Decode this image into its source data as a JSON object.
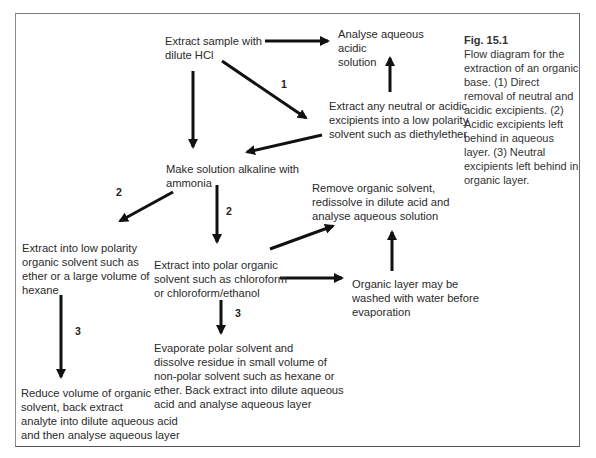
{
  "figure": {
    "caption_title": "Fig. 15.1",
    "caption_text": "Flow diagram for the extraction of an organic base. (1) Direct removal of neutral and acidic excipients. (2) Acidic excipients left behind in aqueous layer. (3) Neutral excipients left behind in organic layer."
  },
  "nodes": {
    "extract_hcl": "Extract sample with\ndilute HCl",
    "analyse_acidic": "Analyse aqueous\nacidic\nsolution",
    "extract_neutral": "Extract any neutral or acidic\nexcipients into a low polarity\nsolvent such as diethylether",
    "make_alkaline": "Make solution alkaline with\nammonia",
    "remove_organic": "Remove organic solvent,\nredissolve in dilute acid and\nanalyse aqueous solution",
    "extract_low_polarity": "Extract into low polarity\norganic solvent such as\nether or a large volume of\nhexane",
    "extract_polar": "Extract into polar organic\nsolvent such as chloroform\nor chloroform/ethanol",
    "organic_wash": "Organic layer may be\nwashed with water before\nevaporation",
    "evaporate_polar": "Evaporate polar solvent and\ndissolve residue in small volume of\nnon-polar solvent such as hexane or\nether. Back extract into dilute aqueous\nacid and analyse aqueous layer",
    "reduce_volume": "Reduce volume of organic\nsolvent, back extract\nanalyte into dilute aqueous acid\nand then analyse aqueous layer"
  },
  "labels": {
    "route1": "1",
    "route2_left": "2",
    "route2_down": "2",
    "route3_left": "3",
    "route3_mid": "3"
  }
}
